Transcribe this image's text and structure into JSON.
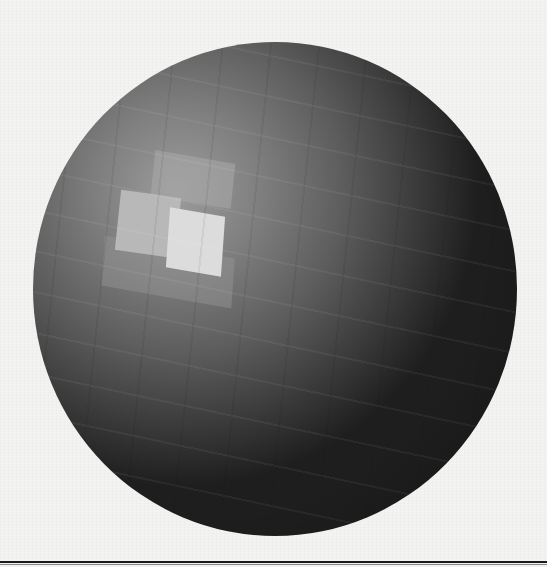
{
  "image": {
    "subject": "Faceted shaded sphere (flat-shaded polygon rendering)",
    "background_color": "#f3f3f1",
    "colors": {
      "highlight": "#dcdcdc",
      "midtone": "#7e7e7e",
      "shadow": "#1e1e1e",
      "rule": "#1a1a1a"
    }
  }
}
